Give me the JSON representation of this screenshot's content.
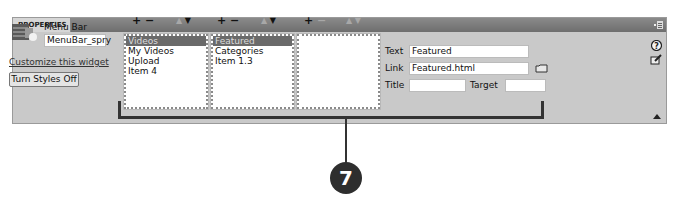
{
  "panel": {
    "tab_label": "PROPERTIES"
  },
  "widget": {
    "type_label": "Menu Bar",
    "id_value": "MenuBar_spry",
    "customize_link": "Customize this widget",
    "styles_button": "Turn Styles Off"
  },
  "lists": [
    {
      "add": "+",
      "remove": "−",
      "up": "▲",
      "down": "▼",
      "items": [
        "Videos",
        "My Videos",
        "Upload",
        "Item 4"
      ],
      "selected_index": 0
    },
    {
      "add": "+",
      "remove": "−",
      "up": "▲",
      "down": "▼",
      "items": [
        "Featured",
        "Categories",
        "Item 1.3"
      ],
      "selected_index": 0
    },
    {
      "add": "+",
      "remove": "−",
      "up": "▲",
      "down": "▼",
      "items": [],
      "selected_index": null
    }
  ],
  "properties": {
    "text_label": "Text",
    "text_value": "Featured",
    "link_label": "Link",
    "link_value": "Featured.html",
    "title_label": "Title",
    "title_value": "",
    "target_label": "Target",
    "target_value": ""
  },
  "icons": {
    "widget": "menu-bar-widget-icon",
    "panel_menu": "panel-options-icon",
    "help": "help-icon",
    "edit": "edit-icon",
    "folder": "folder-icon",
    "collapse": "collapse-arrow-icon"
  },
  "callout": {
    "number": "7"
  }
}
